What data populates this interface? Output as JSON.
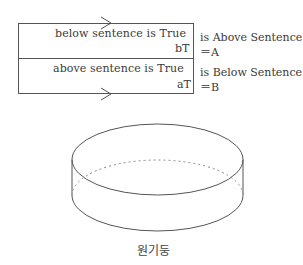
{
  "diagram": {
    "paradox_box": {
      "top_row": {
        "sentence": "below sentence is True",
        "tag": "bT"
      },
      "bottom_row": {
        "sentence": "above sentence is True",
        "tag": "aT"
      },
      "arrows": [
        {
          "position": "top-edge",
          "direction": "right"
        },
        {
          "position": "bottom-edge",
          "direction": "right"
        }
      ]
    },
    "side_notes": {
      "top": {
        "line1": "is Above Sentence",
        "line2": "＝A"
      },
      "bottom": {
        "line1": "is Below Sentence",
        "line2": "＝B"
      }
    },
    "cylinder": {
      "caption": "원기둥",
      "line_color": "#555555"
    }
  }
}
